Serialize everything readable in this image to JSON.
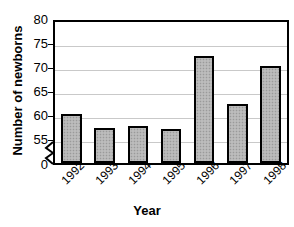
{
  "chart_data": {
    "type": "bar",
    "title": "",
    "xlabel": "Year",
    "ylabel": "Number of newborns",
    "categories": [
      "1992",
      "1993",
      "1994",
      "1995",
      "1996",
      "1997",
      "1998"
    ],
    "values": [
      60,
      57,
      57.5,
      56.8,
      72,
      62,
      70
    ],
    "ylim": [
      55,
      80
    ],
    "y_axis_break": true,
    "y_ticks": [
      "80",
      "75",
      "70",
      "65",
      "60",
      "55",
      "0"
    ],
    "y_tick_values": [
      80,
      75,
      70,
      65,
      60,
      55,
      0
    ],
    "gridlines": true,
    "legend": "none",
    "bar_fill_color": "#b4b4b4",
    "bar_border_color": "#000000",
    "gridline_color": "#c9c9c9",
    "frame_color": "#000000",
    "note": "Small bars for 1993-1995 are drawn just above the broken axis baseline"
  },
  "axis": {
    "y_title": "Number of newborns",
    "x_title": "Year"
  },
  "title_remnant": ""
}
